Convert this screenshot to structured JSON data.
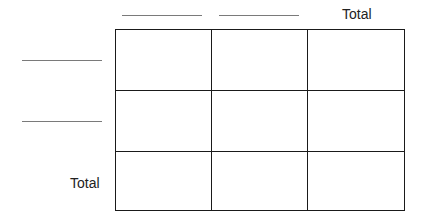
{
  "table": {
    "column_headers": [
      {
        "type": "blank",
        "label": ""
      },
      {
        "type": "blank",
        "label": ""
      },
      {
        "type": "text",
        "label": "Total"
      }
    ],
    "row_headers": [
      {
        "type": "blank",
        "label": ""
      },
      {
        "type": "blank",
        "label": ""
      },
      {
        "type": "text",
        "label": "Total"
      }
    ],
    "rows": [
      [
        "",
        "",
        ""
      ],
      [
        "",
        "",
        ""
      ],
      [
        "",
        "",
        ""
      ]
    ]
  },
  "colors": {
    "grid_line": "#1a1a1a",
    "blank_line": "#7a7a7a",
    "background": "#ffffff"
  }
}
